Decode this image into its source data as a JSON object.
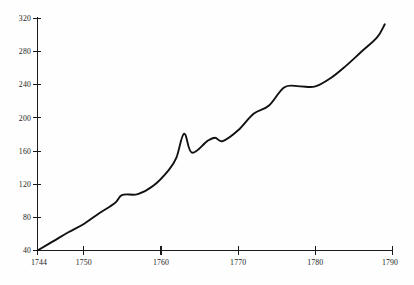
{
  "chart_data": {
    "type": "line",
    "title": "",
    "subtitle": "",
    "xlabel": "",
    "ylabel": "",
    "xlim": [
      1744,
      1790
    ],
    "ylim": [
      40,
      320
    ],
    "grid": false,
    "legend": null,
    "legend_position": "none",
    "x_ticks": [
      1744,
      1750,
      1760,
      1770,
      1780,
      1790
    ],
    "x_tick_labels": [
      "1744",
      "1750",
      "1760",
      "1770",
      "1780",
      "1790"
    ],
    "y_ticks": [
      40,
      80,
      120,
      160,
      200,
      240,
      280,
      320
    ],
    "y_tick_labels": [
      "40",
      "80",
      "120",
      "160",
      "200",
      "240",
      "280",
      "320"
    ],
    "line_color": "#111111",
    "axis_color": "#1a1a1a",
    "background_color": "#fefefe",
    "annotations": [],
    "x": [
      1744,
      1746,
      1748,
      1750,
      1752,
      1754,
      1755,
      1757,
      1759,
      1761,
      1762,
      1763,
      1764,
      1766,
      1767,
      1768,
      1770,
      1772,
      1774,
      1776,
      1778,
      1780,
      1782,
      1784,
      1786,
      1788,
      1789
    ],
    "values": [
      40,
      51,
      62,
      72,
      85,
      97,
      107,
      108,
      118,
      137,
      152,
      181,
      158,
      172,
      176,
      172,
      185,
      205,
      215,
      237,
      238,
      238,
      248,
      263,
      280,
      297,
      313
    ],
    "series": [
      {
        "name": "series-1",
        "values": [
          40,
          51,
          62,
          72,
          85,
          97,
          107,
          108,
          118,
          137,
          152,
          181,
          158,
          172,
          176,
          172,
          185,
          205,
          215,
          237,
          238,
          238,
          248,
          263,
          280,
          297,
          313
        ]
      }
    ]
  },
  "axes": {
    "y_axis_name": "value-axis",
    "x_axis_name": "year-axis"
  }
}
